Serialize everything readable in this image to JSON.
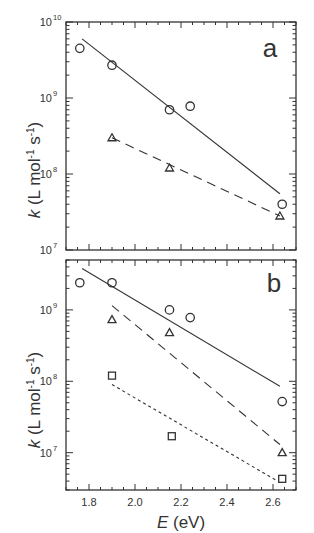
{
  "chart_data": [
    {
      "panel": "a",
      "type": "scatter",
      "title": "",
      "panel_label": "a",
      "xlabel": "E (eV)",
      "ylabel": "k (L mol-1 s-1)",
      "xlim": [
        1.7,
        2.7
      ],
      "ylim": [
        10000000.0,
        10000000000.0
      ],
      "yscale": "log",
      "ytick_labels": [
        "10^7",
        "10^8",
        "10^9",
        "10^10"
      ],
      "xtick_labels_shown": false,
      "grid": false,
      "legend": "none",
      "series": [
        {
          "name": "circles",
          "marker": "circle",
          "x": [
            1.76,
            1.9,
            2.15,
            2.24,
            2.64
          ],
          "y": [
            4500000000.0,
            2700000000.0,
            700000000.0,
            780000000.0,
            40000000.0
          ]
        },
        {
          "name": "triangles",
          "marker": "triangle",
          "x": [
            1.9,
            2.15,
            2.63
          ],
          "y": [
            300000000.0,
            120000000.0,
            28000000.0
          ]
        }
      ],
      "fit_lines": [
        {
          "name": "circle fit",
          "style": "solid",
          "x": [
            1.77,
            2.63
          ],
          "y": [
            6000000000.0,
            55000000.0
          ]
        },
        {
          "name": "triangle fit",
          "style": "dashed",
          "x": [
            1.9,
            2.63
          ],
          "y": [
            300000000.0,
            28000000.0
          ]
        }
      ]
    },
    {
      "panel": "b",
      "type": "scatter",
      "title": "",
      "panel_label": "b",
      "xlabel": "E (eV)",
      "ylabel": "k (L mol-1 s-1)",
      "xlim": [
        1.7,
        2.7
      ],
      "ylim": [
        3000000.0,
        5000000000.0
      ],
      "yscale": "log",
      "xticks": [
        1.8,
        2.0,
        2.2,
        2.4,
        2.6
      ],
      "xtick_labels": [
        "1.8",
        "2.0",
        "2.2",
        "2.4",
        "2.6"
      ],
      "ytick_labels": [
        "10^7",
        "10^8",
        "10^9"
      ],
      "grid": false,
      "legend": "none",
      "series": [
        {
          "name": "circles",
          "marker": "circle",
          "x": [
            1.76,
            1.9,
            2.15,
            2.24,
            2.64
          ],
          "y": [
            2400000000.0,
            2400000000.0,
            1000000000.0,
            780000000.0,
            52000000.0
          ]
        },
        {
          "name": "triangles",
          "marker": "triangle",
          "x": [
            1.9,
            2.15,
            2.64
          ],
          "y": [
            730000000.0,
            480000000.0,
            10000000.0
          ]
        },
        {
          "name": "squares",
          "marker": "square",
          "x": [
            1.9,
            2.16,
            2.64
          ],
          "y": [
            120000000.0,
            17000000.0,
            4300000.0
          ]
        }
      ],
      "fit_lines": [
        {
          "name": "circle fit",
          "style": "solid",
          "x": [
            1.77,
            2.63
          ],
          "y": [
            3800000000.0,
            85000000.0
          ]
        },
        {
          "name": "triangle fit",
          "style": "dashed",
          "x": [
            1.9,
            2.63
          ],
          "y": [
            1150000000.0,
            13000000.0
          ]
        },
        {
          "name": "square fit",
          "style": "dotted",
          "x": [
            1.9,
            2.62
          ],
          "y": [
            90000000.0,
            4000000.0
          ]
        }
      ]
    }
  ],
  "labels": {
    "panel_a": "a",
    "panel_b": "b",
    "y_axis_a": "k (L mol-1 s-1)",
    "y_axis_b": "k (L mol-1 s-1)",
    "x_axis": "E (eV)",
    "x_ticks": [
      "1.8",
      "2.0",
      "2.2",
      "2.4",
      "2.6"
    ],
    "y_ticks_a": [
      "10",
      "10",
      "10",
      "10"
    ],
    "y_exp_a": [
      "10",
      "9",
      "8",
      "7"
    ],
    "y_ticks_b": [
      "10",
      "10",
      "10"
    ],
    "y_exp_b": [
      "9",
      "8",
      "7"
    ]
  },
  "colors": {
    "ink": "#333333",
    "background": "#ffffff"
  }
}
